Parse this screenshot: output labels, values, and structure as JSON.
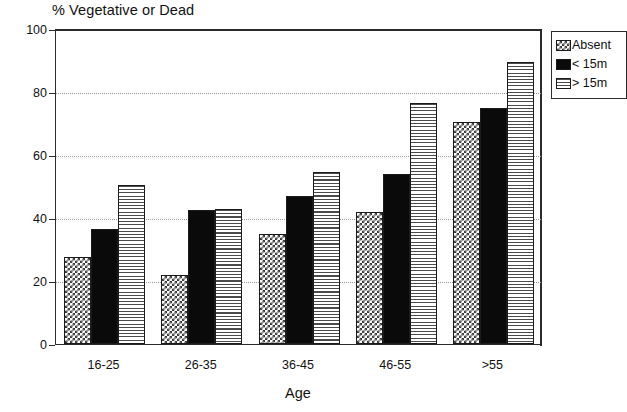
{
  "chart_data": {
    "type": "bar",
    "title": "% Vegetative or Dead",
    "xlabel": "Age",
    "ylabel": "",
    "ylim": [
      0,
      100
    ],
    "yticks": [
      0,
      20,
      40,
      60,
      80,
      100
    ],
    "grid": "horizontal-dotted",
    "legend_position": "top-right-outside",
    "categories": [
      "16-25",
      "26-35",
      "36-45",
      "46-55",
      ">55"
    ],
    "series": [
      {
        "name": "Absent",
        "values": [
          27.5,
          22,
          35,
          42,
          70.5
        ]
      },
      {
        "name": "< 15m",
        "values": [
          36.5,
          42.5,
          47,
          54,
          75
        ]
      },
      {
        "name": "> 15m",
        "values": [
          50.5,
          43,
          54.5,
          76.5,
          89.5
        ]
      }
    ]
  },
  "legend": {
    "items": [
      {
        "label": "Absent",
        "swatch": "checker-pattern-swatch"
      },
      {
        "label": "< 15m",
        "swatch": "solid-black-swatch"
      },
      {
        "label": "> 15m",
        "swatch": "horizontal-lines-swatch"
      }
    ]
  }
}
